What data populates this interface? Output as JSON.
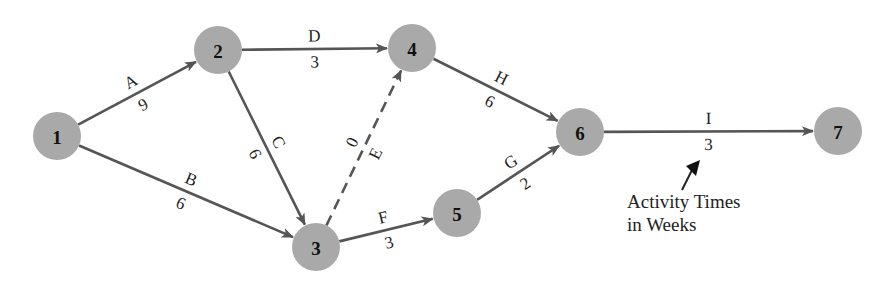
{
  "diagram": {
    "type": "activity-on-arrow network",
    "nodes": [
      {
        "id": "1",
        "label": "1",
        "x": 57,
        "y": 136
      },
      {
        "id": "2",
        "label": "2",
        "x": 218,
        "y": 50
      },
      {
        "id": "3",
        "label": "3",
        "x": 316,
        "y": 247
      },
      {
        "id": "4",
        "label": "4",
        "x": 412,
        "y": 48
      },
      {
        "id": "5",
        "label": "5",
        "x": 457,
        "y": 213
      },
      {
        "id": "6",
        "label": "6",
        "x": 580,
        "y": 132
      },
      {
        "id": "7",
        "label": "7",
        "x": 838,
        "y": 131
      }
    ],
    "edges": [
      {
        "activity": "A",
        "from": "1",
        "to": "2",
        "time": "9",
        "dashed": false
      },
      {
        "activity": "B",
        "from": "1",
        "to": "3",
        "time": "6",
        "dashed": false
      },
      {
        "activity": "C",
        "from": "2",
        "to": "3",
        "time": "6",
        "dashed": false
      },
      {
        "activity": "D",
        "from": "2",
        "to": "4",
        "time": "3",
        "dashed": false
      },
      {
        "activity": "E",
        "from": "3",
        "to": "4",
        "time": "0",
        "dashed": true
      },
      {
        "activity": "F",
        "from": "3",
        "to": "5",
        "time": "3",
        "dashed": false
      },
      {
        "activity": "G",
        "from": "5",
        "to": "6",
        "time": "2",
        "dashed": false
      },
      {
        "activity": "H",
        "from": "4",
        "to": "6",
        "time": "6",
        "dashed": false
      },
      {
        "activity": "I",
        "from": "6",
        "to": "7",
        "time": "3",
        "dashed": false
      }
    ],
    "annotation": {
      "line1": "Activity Times",
      "line2": "in Weeks"
    },
    "colors": {
      "node_fill": "#a9a9a9",
      "edge": "#555555",
      "text": "#222222"
    }
  }
}
